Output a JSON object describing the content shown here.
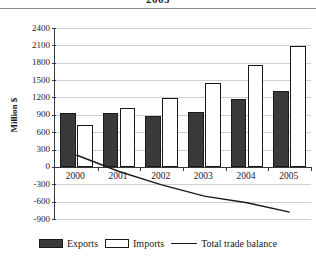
{
  "title": "2005",
  "axis": {
    "ylabel": "Million $",
    "ymin": -900,
    "ymax": 2400,
    "ystep": 300,
    "yticks": [
      "2400",
      "2100",
      "1800",
      "1500",
      "1200",
      "900",
      "600",
      "300",
      "0",
      "-300",
      "-600",
      "-900"
    ]
  },
  "legend": {
    "items": [
      {
        "label": "Exports",
        "swatch": "filled-dark-square",
        "color": "#3a3a3a"
      },
      {
        "label": "Imports",
        "swatch": "hollow-white-square",
        "color": "#ffffff"
      },
      {
        "label": "Total trade balance",
        "swatch": "line-segment",
        "color": "#1a1a1a"
      }
    ]
  },
  "chart_data": {
    "type": "bar",
    "title": "2005",
    "xlabel": "",
    "ylabel": "Million $",
    "ylim": [
      -900,
      2400
    ],
    "grid": true,
    "legend_position": "bottom",
    "categories": [
      "2000",
      "2001",
      "2002",
      "2003",
      "2004",
      "2005"
    ],
    "series": [
      {
        "name": "Exports",
        "type": "bar",
        "color": "#3a3a3a",
        "values": [
          925,
          930,
          880,
          950,
          1170,
          1310
        ]
      },
      {
        "name": "Imports",
        "type": "bar",
        "color": "#ffffff",
        "values": [
          720,
          1010,
          1190,
          1455,
          1760,
          2090
        ]
      },
      {
        "name": "Total trade balance",
        "type": "line",
        "color": "#1a1a1a",
        "values": [
          205,
          -80,
          -310,
          -505,
          -620,
          -780
        ]
      }
    ]
  }
}
